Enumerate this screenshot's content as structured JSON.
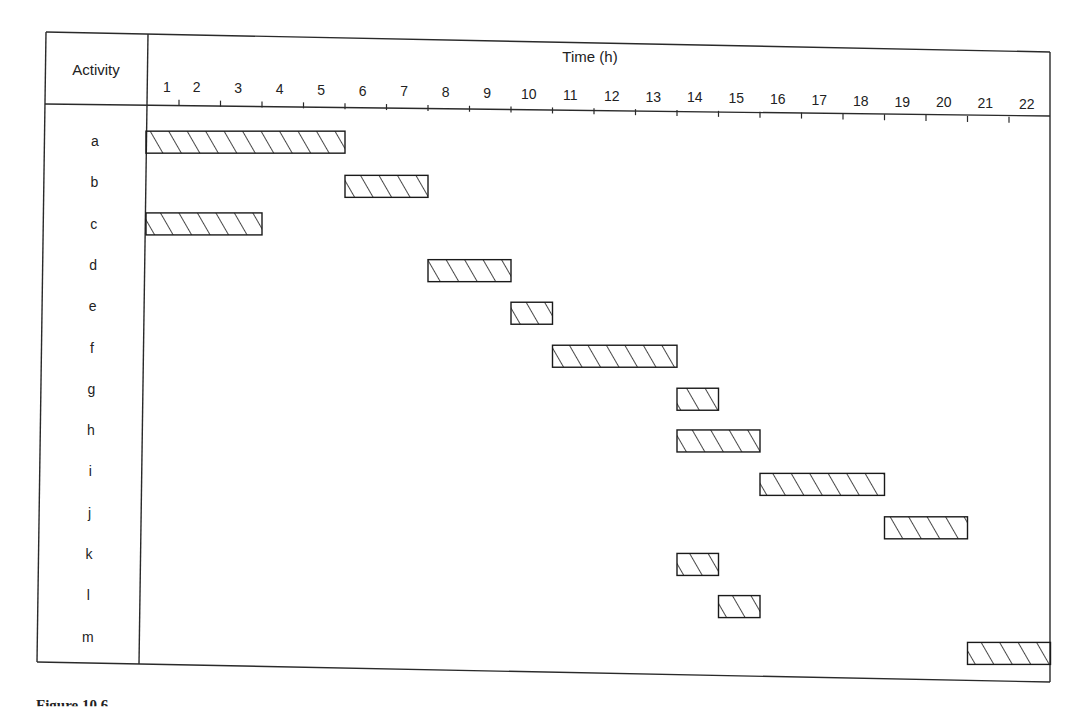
{
  "chart_data": {
    "type": "gantt",
    "title": "",
    "header": {
      "row_label_header": "Activity",
      "time_axis_label": "Time (h)"
    },
    "xlabel": "Time (h)",
    "ylabel": "Activity",
    "x_tick_labels": [
      "1",
      "2",
      "3",
      "4",
      "5",
      "6",
      "7",
      "8",
      "9",
      "10",
      "11",
      "12",
      "13",
      "14",
      "15",
      "16",
      "17",
      "18",
      "19",
      "20",
      "21",
      "22"
    ],
    "xlim": [
      0,
      22
    ],
    "grid": false,
    "legend": null,
    "bar_style": "diagonal hatch, black outline",
    "activities": [
      {
        "name": "a",
        "start": 0,
        "end": 5
      },
      {
        "name": "b",
        "start": 5,
        "end": 7
      },
      {
        "name": "c",
        "start": 0,
        "end": 3
      },
      {
        "name": "d",
        "start": 7,
        "end": 9
      },
      {
        "name": "e",
        "start": 9,
        "end": 10
      },
      {
        "name": "f",
        "start": 10,
        "end": 13
      },
      {
        "name": "g",
        "start": 13,
        "end": 14
      },
      {
        "name": "h",
        "start": 13,
        "end": 15
      },
      {
        "name": "i",
        "start": 15,
        "end": 18
      },
      {
        "name": "j",
        "start": 18,
        "end": 20
      },
      {
        "name": "k",
        "start": 13,
        "end": 14
      },
      {
        "name": "l",
        "start": 14,
        "end": 15
      },
      {
        "name": "m",
        "start": 20,
        "end": 22
      }
    ],
    "categories": [
      "a",
      "b",
      "c",
      "d",
      "e",
      "f",
      "g",
      "h",
      "i",
      "j",
      "k",
      "l",
      "m"
    ],
    "series": [
      {
        "name": "start (h)",
        "values": [
          0,
          5,
          0,
          7,
          9,
          10,
          13,
          13,
          15,
          18,
          13,
          14,
          20
        ]
      },
      {
        "name": "duration (h)",
        "values": [
          5,
          2,
          3,
          2,
          1,
          3,
          1,
          2,
          3,
          2,
          1,
          1,
          2
        ]
      }
    ]
  },
  "caption": {
    "text": "Figure 10.6"
  },
  "colors": {
    "line": "#2a2a2a",
    "background": "#ffffff"
  }
}
